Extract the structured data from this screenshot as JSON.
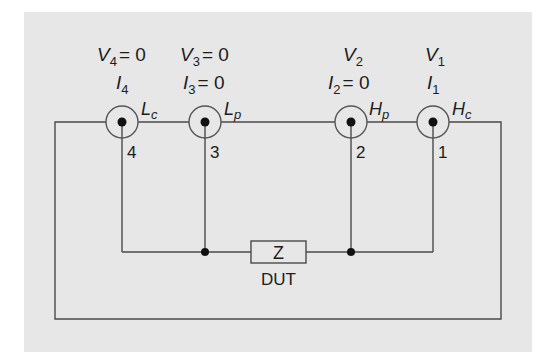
{
  "diagram": {
    "colors": {
      "panel": "#e7e7e7",
      "wire": "#4a4a4a",
      "text": "#1c1c1c",
      "dot": "#111111"
    },
    "terminals": [
      {
        "number": "4",
        "name_main": "L",
        "name_sub": "c",
        "voltage_label": "V",
        "voltage_sub": "4",
        "voltage_eq": "= 0",
        "current_label": "I",
        "current_sub": "4",
        "current_eq": ""
      },
      {
        "number": "3",
        "name_main": "L",
        "name_sub": "p",
        "voltage_label": "V",
        "voltage_sub": "3",
        "voltage_eq": "= 0",
        "current_label": "I",
        "current_sub": "3",
        "current_eq": "= 0"
      },
      {
        "number": "2",
        "name_main": "H",
        "name_sub": "p",
        "voltage_label": "V",
        "voltage_sub": "2",
        "voltage_eq": "",
        "current_label": "I",
        "current_sub": "2",
        "current_eq": "= 0"
      },
      {
        "number": "1",
        "name_main": "H",
        "name_sub": "c",
        "voltage_label": "V",
        "voltage_sub": "1",
        "voltage_eq": "",
        "current_label": "I",
        "current_sub": "1",
        "current_eq": ""
      }
    ],
    "dut": {
      "symbol": "Z",
      "label": "DUT"
    }
  }
}
